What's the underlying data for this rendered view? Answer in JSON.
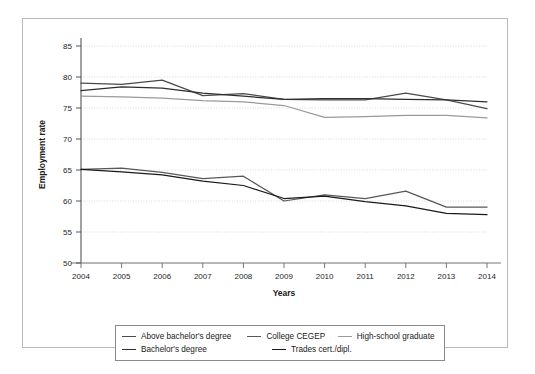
{
  "chart_data": {
    "type": "line",
    "title": "",
    "xlabel": "Years",
    "ylabel": "Employment rate",
    "x": [
      2004,
      2005,
      2006,
      2007,
      2008,
      2009,
      2010,
      2011,
      2012,
      2013,
      2014
    ],
    "categories": [
      "2004",
      "2005",
      "2006",
      "2007",
      "2008",
      "2009",
      "2010",
      "2011",
      "2012",
      "2013",
      "2014"
    ],
    "xlim": [
      2004,
      2014
    ],
    "ylim": [
      50,
      85
    ],
    "yticks": [
      50,
      55,
      60,
      65,
      70,
      75,
      80,
      85
    ],
    "grid": "horizontal-dotted",
    "legend_position": "bottom",
    "series": [
      {
        "name": "Above bachelor's degree",
        "color": "#4a4a4a",
        "values": [
          79.0,
          78.8,
          79.5,
          77.0,
          77.3,
          76.4,
          76.3,
          76.3,
          77.4,
          76.3,
          74.9
        ]
      },
      {
        "name": "Bachelor's degree",
        "color": "#2e2e2e",
        "values": [
          77.8,
          78.4,
          78.2,
          77.4,
          76.9,
          76.4,
          76.5,
          76.5,
          76.4,
          76.3,
          76.0
        ]
      },
      {
        "name": "College CEGEP",
        "color": "#585858",
        "values": [
          65.1,
          65.3,
          64.6,
          63.6,
          64.0,
          60.0,
          61.0,
          60.4,
          61.6,
          59.0,
          59.0
        ]
      },
      {
        "name": "High-school graduate",
        "color": "#9a9a9a",
        "values": [
          76.9,
          76.8,
          76.6,
          76.2,
          76.0,
          75.4,
          73.5,
          73.6,
          73.8,
          73.8,
          73.4
        ]
      },
      {
        "name": "Trades cert./dipl.",
        "color": "#1a1a1a",
        "values": [
          65.1,
          64.7,
          64.2,
          63.2,
          62.5,
          60.4,
          60.8,
          59.9,
          59.2,
          58.0,
          57.8
        ]
      }
    ]
  },
  "axes": {
    "ylabel": "Employment rate",
    "xlabel": "Years",
    "ytick_labels": [
      "85",
      "80",
      "75",
      "70",
      "65",
      "60",
      "55",
      "50"
    ],
    "xtick_labels": [
      "2004",
      "2005",
      "2006",
      "2007",
      "2008",
      "2009",
      "2010",
      "2011",
      "2012",
      "2013",
      "2014"
    ]
  },
  "legend": {
    "rows": [
      [
        {
          "label": "Above bachelor's degree",
          "color": "#4a4a4a",
          "width": 150
        },
        {
          "label": "College CEGEP",
          "color": "#585858",
          "width": 108
        },
        {
          "label": "High-school graduate",
          "color": "#9a9a9a",
          "width": 120
        }
      ],
      [
        {
          "label": "Bachelor's degree",
          "color": "#2e2e2e",
          "width": 150
        },
        {
          "label": "Trades cert./dipl.",
          "color": "#1a1a1a",
          "width": 108
        }
      ]
    ]
  }
}
